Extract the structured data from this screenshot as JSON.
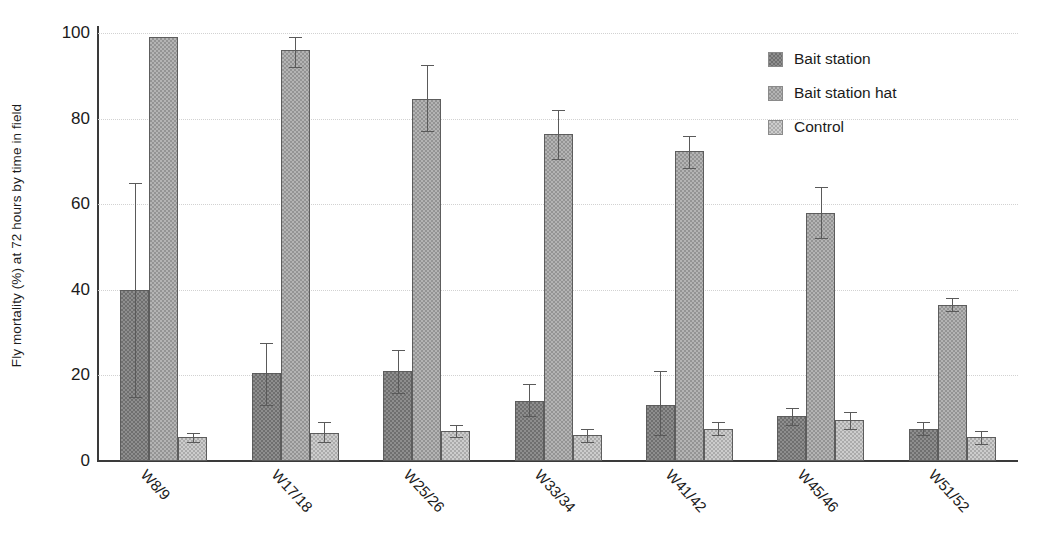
{
  "chart_data": {
    "type": "bar",
    "title": "",
    "xlabel": "",
    "ylabel": "Fly mortality (%) at 72 hours by time in field",
    "ylim": [
      0,
      100
    ],
    "yticks": [
      0,
      20,
      40,
      60,
      80,
      100
    ],
    "grid": true,
    "legend_position": "top-right",
    "xtick_rotation": 47,
    "categories": [
      "W8/9",
      "W17/18",
      "W25/26",
      "W33/34",
      "W41/42",
      "W45/46",
      "W51/52"
    ],
    "series": [
      {
        "name": "Bait station",
        "color": "#8e8e8e",
        "values": [
          40.0,
          20.5,
          21.0,
          14.0,
          13.0,
          10.5,
          7.5
        ],
        "err_low": [
          15.0,
          13.0,
          16.0,
          10.5,
          6.0,
          8.5,
          6.0
        ],
        "err_high": [
          65.0,
          27.5,
          26.0,
          18.0,
          21.0,
          12.5,
          9.0
        ]
      },
      {
        "name": "Bait station hat",
        "color": "#b4b4b4",
        "values": [
          99.0,
          96.0,
          84.5,
          76.5,
          72.5,
          58.0,
          36.5
        ],
        "err_low": [
          99.0,
          92.0,
          77.0,
          70.5,
          68.5,
          52.0,
          35.0
        ],
        "err_high": [
          99.0,
          99.0,
          92.5,
          82.0,
          76.0,
          64.0,
          38.0
        ]
      },
      {
        "name": "Control",
        "color": "#cdcdcd",
        "values": [
          5.5,
          6.5,
          7.0,
          6.0,
          7.5,
          9.5,
          5.5
        ],
        "err_low": [
          4.5,
          4.5,
          5.5,
          4.5,
          6.0,
          7.5,
          4.0
        ],
        "err_high": [
          6.5,
          9.0,
          8.5,
          7.5,
          9.0,
          11.5,
          7.0
        ]
      }
    ]
  },
  "legend": {
    "items": [
      {
        "label": "Bait station"
      },
      {
        "label": "Bait station hat"
      },
      {
        "label": "Control"
      }
    ]
  }
}
